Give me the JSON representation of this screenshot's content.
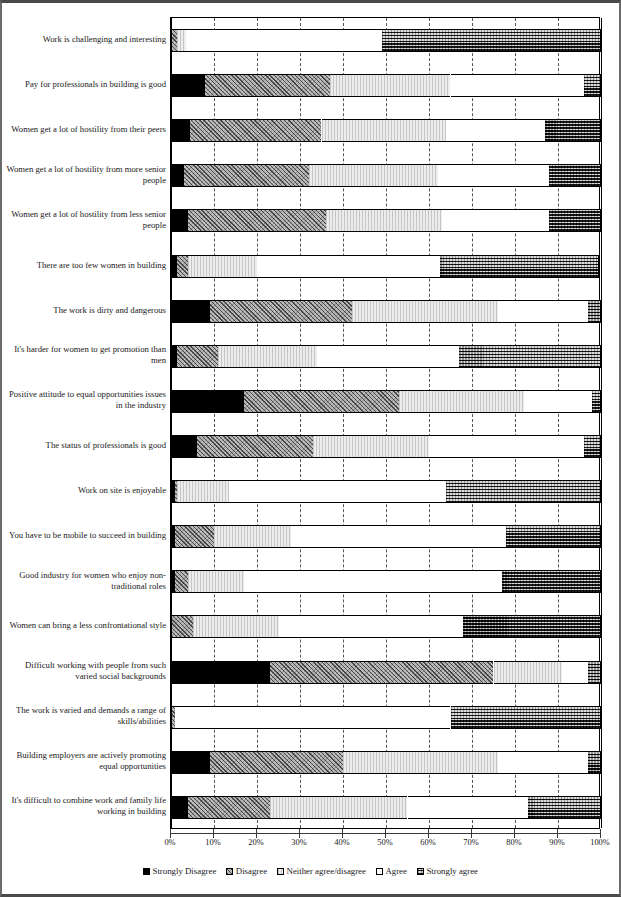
{
  "chart_data": {
    "type": "bar",
    "subtype": "stacked-horizontal-100-percent",
    "title": "",
    "xlabel": "",
    "ylabel": "",
    "xlim": [
      0,
      100
    ],
    "xunit": "%",
    "grid": true,
    "grid_axis": "x",
    "legend_position": "bottom",
    "x_ticks": [
      "0%",
      "10%",
      "20%",
      "30%",
      "40%",
      "50%",
      "60%",
      "70%",
      "80%",
      "90%",
      "100%"
    ],
    "x_tick_values": [
      0,
      10,
      20,
      30,
      40,
      50,
      60,
      70,
      80,
      90,
      100
    ],
    "series": [
      {
        "name": "Strongly Disagree",
        "fill": "solid-black",
        "color": "#000000",
        "values": [
          0.0,
          8.0,
          4.5,
          3.0,
          4.0,
          1.5,
          9.0,
          1.5,
          17.0,
          6.0,
          1.0,
          1.0,
          1.0,
          0.0,
          23.0,
          0.0,
          9.0,
          4.0
        ]
      },
      {
        "name": "Disagree",
        "fill": "diagonal-hatch",
        "color": "#bdbdbd",
        "values": [
          1.5,
          29.0,
          30.5,
          29.0,
          32.0,
          2.5,
          33.0,
          9.5,
          36.0,
          27.0,
          0.5,
          9.0,
          3.0,
          5.0,
          52.0,
          1.0,
          31.0,
          19.0
        ]
      },
      {
        "name": "Neither agree/disagree",
        "fill": "light-vertical-lines",
        "color": "#ececec",
        "values": [
          2.0,
          28.0,
          29.0,
          30.0,
          27.0,
          16.0,
          34.0,
          23.0,
          29.0,
          27.0,
          12.0,
          18.0,
          13.0,
          20.0,
          16.0,
          0.0,
          36.0,
          32.0
        ]
      },
      {
        "name": "Agree",
        "fill": "white",
        "color": "#ffffff",
        "values": [
          45.5,
          31.0,
          23.0,
          26.0,
          25.0,
          42.5,
          21.0,
          33.0,
          16.0,
          36.0,
          50.5,
          50.0,
          60.0,
          43.0,
          6.0,
          64.0,
          21.0,
          28.0
        ]
      },
      {
        "name": "Strongly agree",
        "fill": "cross-hatch-dark",
        "color": "#4f4f4f",
        "values": [
          51.0,
          4.0,
          13.0,
          12.0,
          12.0,
          37.0,
          3.0,
          33.0,
          2.0,
          4.0,
          36.0,
          22.0,
          23.0,
          32.0,
          3.0,
          35.0,
          3.0,
          17.0
        ]
      }
    ],
    "categories": [
      "Work is challenging and interesting",
      "Pay for professionals in building is good",
      "Women get a lot of hostility from their peers",
      "Women get a lot of hostility from more senior people",
      "Women get a lot of hostility from less senior people",
      "There are too few women in building",
      "The work is dirty and dangerous",
      "It's harder for women to get promotion than men",
      "Positive attitude to equal opportunities issues in the industry",
      "The status of professionals is good",
      "Work on site is enjoyable",
      "You have to be mobile to succeed in building",
      "Good industry for women who enjoy non-traditional roles",
      "Women can bring a less confrontational style",
      "Difficult working with people from such varied social backgrounds",
      "The work is varied and demands a range of skills/abilities",
      "Building employers are actively promoting equal opportunities",
      "It's difficult to combine work and family life working in building"
    ]
  },
  "legend": {
    "items": [
      {
        "label": "Strongly Disagree",
        "swatch": "solid-black-swatch"
      },
      {
        "label": "Disagree",
        "swatch": "hatch-swatch"
      },
      {
        "label": "Neither agree/disagree",
        "swatch": "white-swatch"
      },
      {
        "label": "Agree",
        "swatch": "white-swatch"
      },
      {
        "label": "Strongly agree",
        "swatch": "crosshatch-swatch"
      }
    ]
  }
}
